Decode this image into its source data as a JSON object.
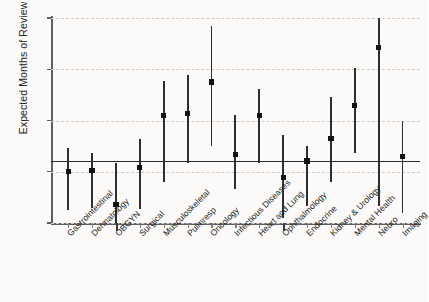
{
  "chart_data": {
    "type": "scatter",
    "title": "",
    "xlabel": "",
    "ylabel": "Expected Months of Review",
    "ylim": [
      12,
      60
    ],
    "yticks": [
      12,
      24,
      36,
      48,
      60
    ],
    "grid": true,
    "legend": "none",
    "reference_line": {
      "label": "Overall mean",
      "value": 26.4
    },
    "categories": [
      "Gastrointestinal",
      "Dermatology",
      "OBGYN",
      "Surgical",
      "Musculoskeletal",
      "Pulmresp",
      "Oncology",
      "Infectious Diseases",
      "Heart and Lung",
      "Ophthalmology",
      "Endocrine",
      "Kidney & Urology",
      "Mental Health",
      "Neuro",
      "Imaging"
    ],
    "series": [
      {
        "name": "Expected Months of Review",
        "values": [
          24.1,
          24.2,
          16.4,
          25.0,
          37.1,
          37.6,
          45.0,
          28.0,
          37.2,
          22.6,
          26.5,
          31.8,
          39.5,
          53.1,
          27.6
        ],
        "lower": [
          15.0,
          15.6,
          12.0,
          15.2,
          21.7,
          26.1,
          30.1,
          19.9,
          26.1,
          13.2,
          16.0,
          21.6,
          28.5,
          16.0,
          14.3
        ],
        "upper": [
          29.5,
          28.4,
          26.0,
          31.7,
          45.2,
          46.6,
          58.2,
          37.4,
          43.3,
          32.5,
          30.1,
          41.5,
          48.3,
          60.0,
          36.0
        ]
      }
    ]
  },
  "axes": {
    "y_title": "Expected Months of Review",
    "y_tick_labels": [
      "60",
      "48",
      "36",
      "24",
      "12"
    ]
  }
}
